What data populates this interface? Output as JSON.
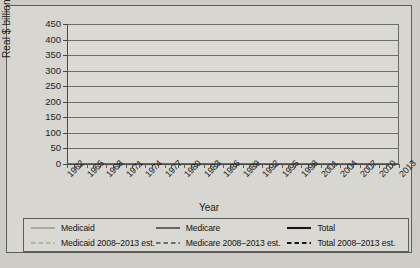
{
  "chart_data": {
    "type": "line",
    "title": "",
    "xlabel": "Year",
    "ylabel": "Real $ billions",
    "ylim": [
      0,
      450
    ],
    "ytick_step": 50,
    "yticks": [
      0,
      50,
      100,
      150,
      200,
      250,
      300,
      350,
      400,
      450
    ],
    "xlim": [
      1962,
      2013
    ],
    "xticks": [
      1962,
      1965,
      1968,
      1971,
      1974,
      1977,
      1980,
      1983,
      1986,
      1989,
      1992,
      1995,
      1998,
      2001,
      2004,
      2007,
      2010,
      2013
    ],
    "xtick_labels": [
      "1962",
      "1965",
      "1968",
      "1971",
      "1974",
      "1977",
      "1980",
      "1983",
      "1986",
      "1989",
      "1992",
      "1995",
      "1998",
      "2001",
      "2004",
      "2007",
      "2010",
      "2013"
    ],
    "minor_xticks_every": 1,
    "grid": "horizontal",
    "legend_position": "bottom",
    "x": [
      1962,
      1963,
      1964,
      1965,
      1966,
      1967,
      1968,
      1969,
      1970,
      1971,
      1972,
      1973,
      1974,
      1975,
      1976,
      1977,
      1978,
      1979,
      1980,
      1981,
      1982,
      1983,
      1984,
      1985,
      1986,
      1987,
      1988,
      1989,
      1990,
      1991,
      1992,
      1993,
      1994,
      1995,
      1996,
      1997,
      1998,
      1999,
      2000,
      2001,
      2002,
      2003,
      2004,
      2005,
      2006,
      2007,
      2008,
      2009,
      2010,
      2011,
      2012,
      2013
    ],
    "series": [
      {
        "name": "Medicaid",
        "style": "solid",
        "color": "#8d8d88",
        "width": 1.2,
        "values": [
          0,
          0,
          0,
          0,
          1,
          3,
          6,
          8,
          10,
          12,
          14,
          16,
          17,
          18,
          20,
          22,
          23,
          25,
          27,
          29,
          30,
          31,
          33,
          35,
          37,
          40,
          44,
          48,
          54,
          62,
          70,
          76,
          80,
          83,
          86,
          88,
          90,
          93,
          97,
          103,
          109,
          113,
          116,
          116,
          114,
          117,
          124,
          null,
          null,
          null,
          null,
          null
        ]
      },
      {
        "name": "Medicare",
        "style": "solid",
        "color": "#4a4a47",
        "width": 1.6,
        "values": [
          0,
          0,
          0,
          0,
          8,
          18,
          22,
          25,
          28,
          30,
          33,
          36,
          40,
          45,
          50,
          55,
          60,
          65,
          70,
          76,
          83,
          90,
          95,
          101,
          106,
          112,
          118,
          126,
          134,
          142,
          152,
          163,
          176,
          190,
          203,
          212,
          208,
          206,
          212,
          225,
          238,
          250,
          263,
          272,
          280,
          290,
          301,
          null,
          null,
          null,
          null,
          null
        ]
      },
      {
        "name": "Total",
        "style": "solid",
        "color": "#17171a",
        "width": 2.1,
        "values": [
          7,
          8,
          9,
          10,
          14,
          25,
          32,
          37,
          42,
          47,
          53,
          58,
          64,
          72,
          80,
          88,
          95,
          103,
          112,
          122,
          132,
          143,
          152,
          162,
          172,
          184,
          197,
          212,
          230,
          250,
          272,
          293,
          316,
          340,
          358,
          372,
          372,
          373,
          385,
          406,
          430,
          450,
          455,
          452,
          450,
          461,
          480,
          null,
          null,
          null,
          null,
          null
        ]
      },
      {
        "name": "Medicaid 2008–2013 est.",
        "style": "dashed",
        "color": "#8d8d88",
        "width": 1.2,
        "values": [
          null,
          null,
          null,
          null,
          null,
          null,
          null,
          null,
          null,
          null,
          null,
          null,
          null,
          null,
          null,
          null,
          null,
          null,
          null,
          null,
          null,
          null,
          null,
          null,
          null,
          null,
          null,
          null,
          null,
          null,
          null,
          null,
          null,
          null,
          null,
          null,
          null,
          null,
          null,
          null,
          null,
          null,
          null,
          null,
          null,
          null,
          124,
          126,
          128,
          130,
          132,
          134
        ]
      },
      {
        "name": "Medicare 2008–2013 est.",
        "style": "dashed",
        "color": "#4a4a47",
        "width": 1.6,
        "values": [
          null,
          null,
          null,
          null,
          null,
          null,
          null,
          null,
          null,
          null,
          null,
          null,
          null,
          null,
          null,
          null,
          null,
          null,
          null,
          null,
          null,
          null,
          null,
          null,
          null,
          null,
          null,
          null,
          null,
          null,
          null,
          null,
          null,
          null,
          null,
          null,
          null,
          null,
          null,
          null,
          null,
          null,
          null,
          null,
          null,
          null,
          301,
          230,
          238,
          242,
          236,
          244
        ]
      },
      {
        "name": "Total 2008–2013 est.",
        "style": "dashed",
        "color": "#17171a",
        "width": 2.1,
        "values": [
          null,
          null,
          null,
          null,
          null,
          null,
          null,
          null,
          null,
          null,
          null,
          null,
          null,
          null,
          null,
          null,
          null,
          null,
          null,
          null,
          null,
          null,
          null,
          null,
          null,
          null,
          null,
          null,
          null,
          null,
          null,
          null,
          null,
          null,
          null,
          null,
          null,
          null,
          null,
          null,
          null,
          null,
          null,
          null,
          null,
          null,
          480,
          370,
          382,
          394,
          398,
          399
        ]
      }
    ],
    "legend": [
      {
        "label": "Medicaid",
        "style": "solid",
        "color": "#8d8d88",
        "width": 1.2
      },
      {
        "label": "Medicare",
        "style": "solid",
        "color": "#4a4a47",
        "width": 1.6
      },
      {
        "label": "Total",
        "style": "solid",
        "color": "#17171a",
        "width": 2.1
      },
      {
        "label": "Medicaid 2008–2013 est.",
        "style": "dashed",
        "color": "#8d8d88",
        "width": 1.2
      },
      {
        "label": "Medicare 2008–2013 est.",
        "style": "dashed",
        "color": "#4a4a47",
        "width": 1.6
      },
      {
        "label": "Total 2008–2013 est.",
        "style": "dashed",
        "color": "#17171a",
        "width": 2.1
      }
    ]
  }
}
